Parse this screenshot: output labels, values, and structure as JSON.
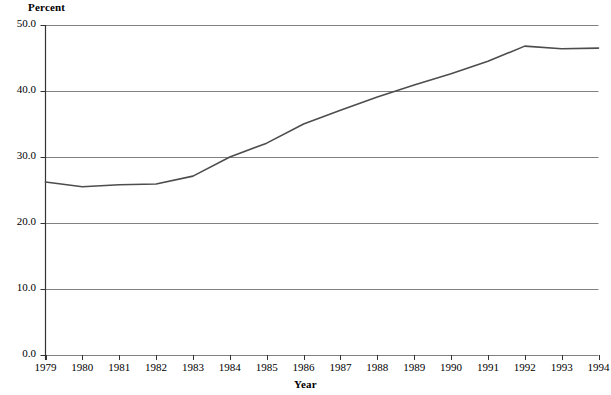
{
  "chart_data": {
    "type": "line",
    "title": "",
    "subtitle": "",
    "xlabel": "Year",
    "ylabel": "Percent",
    "grid": true,
    "legend": null,
    "xlim": [
      1979,
      1994
    ],
    "ylim": [
      0.0,
      50.0
    ],
    "ytick_labels": [
      "0.0",
      "10.0",
      "20.0",
      "30.0",
      "40.0",
      "50.0"
    ],
    "yticks": [
      0.0,
      10.0,
      20.0,
      30.0,
      40.0,
      50.0
    ],
    "categories": [
      1979,
      1980,
      1981,
      1982,
      1983,
      1984,
      1985,
      1986,
      1987,
      1988,
      1989,
      1990,
      1991,
      1992,
      1993,
      1994
    ],
    "xtick_labels": [
      "1979",
      "1980",
      "1981",
      "1982",
      "1983",
      "1984",
      "1985",
      "1986",
      "1987",
      "1988",
      "1989",
      "1990",
      "1991",
      "1992",
      "1993",
      "1994"
    ],
    "values": [
      26.2,
      25.5,
      25.8,
      25.9,
      27.1,
      30.0,
      32.1,
      35.0,
      37.1,
      39.1,
      40.9,
      42.6,
      44.5,
      46.8,
      46.4,
      46.5
    ],
    "series": [
      {
        "name": "Percent",
        "color": "#4d4d4d",
        "values": [
          26.2,
          25.5,
          25.8,
          25.9,
          27.1,
          30.0,
          32.1,
          35.0,
          37.1,
          39.1,
          40.9,
          42.6,
          44.5,
          46.8,
          46.4,
          46.5
        ]
      }
    ],
    "colors": {
      "line": "#4d4d4d",
      "grid": "#808080",
      "axis": "#333333",
      "text": "#000000",
      "background": "#ffffff"
    }
  }
}
